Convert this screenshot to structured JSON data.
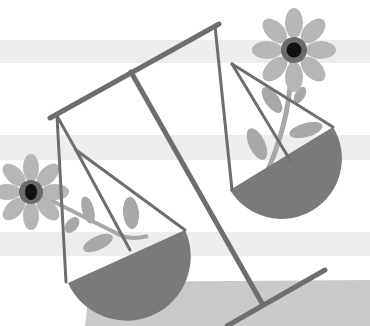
{
  "image": {
    "subject": "balance scale with flowers illustration",
    "width": 370,
    "height": 326
  },
  "colors": {
    "background": "#ffffff",
    "band": "#ececec",
    "ground": "#c9c9c9",
    "line": "#6e6e6e",
    "pan": "#7a7a7a",
    "petal": "#b4b4b4",
    "leaf": "#a6a6a6",
    "stem": "#a6a6a6",
    "flower_ring": "#6a6a6a",
    "flower_center": "#111111"
  }
}
